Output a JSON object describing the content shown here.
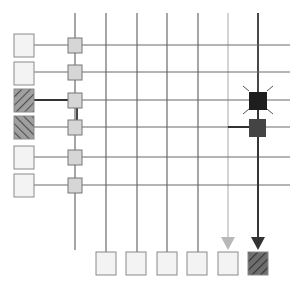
{
  "diagram": {
    "colors": {
      "grid_line": "#6a6a6a",
      "box_fill": "#f3f3f3",
      "box_stroke": "#8a8a8a",
      "node_fill": "#d6d6d6",
      "hatch_fill": "#9a9a9a",
      "hatch_line": "#555555",
      "active_node": "#1e1e1e",
      "active_node2": "#444444",
      "light_arrow": "#b8b8b8",
      "dark_arrow": "#333333"
    },
    "rows_y": [
      45,
      72,
      100,
      127,
      157,
      185
    ],
    "cols_x": [
      106,
      137,
      167,
      198,
      228,
      258
    ],
    "bus_x": 75,
    "inputs": [
      {
        "y": 34,
        "pattern": "plain"
      },
      {
        "y": 62,
        "pattern": "plain"
      },
      {
        "y": 89,
        "pattern": "hatch-forward"
      },
      {
        "y": 116,
        "pattern": "hatch-back"
      },
      {
        "y": 146,
        "pattern": "plain"
      },
      {
        "y": 174,
        "pattern": "plain"
      }
    ],
    "outputs": [
      {
        "x": 96,
        "pattern": "plain"
      },
      {
        "x": 126,
        "pattern": "plain"
      },
      {
        "x": 157,
        "pattern": "plain"
      },
      {
        "x": 187,
        "pattern": "plain"
      },
      {
        "x": 218,
        "pattern": "plain",
        "arrow": "light"
      },
      {
        "x": 248,
        "pattern": "hatch-forward",
        "arrow": "dark"
      }
    ],
    "active_nodes": [
      {
        "row": 2,
        "col": 5,
        "style": "spark"
      },
      {
        "row": 3,
        "col": 5,
        "style": "solid"
      }
    ]
  }
}
